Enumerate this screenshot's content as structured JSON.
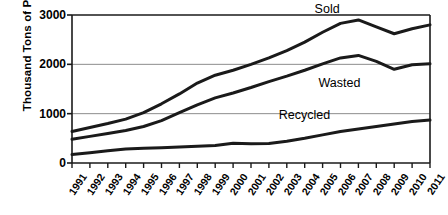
{
  "chart_data": {
    "type": "line",
    "title": "",
    "xlabel": "",
    "ylabel": "Thousand Tons of PET",
    "ylim": [
      0,
      3000
    ],
    "yticks": [
      0,
      1000,
      2000,
      3000
    ],
    "gridlines": [
      1000,
      2000
    ],
    "grid": true,
    "legend_position": "inline-labels",
    "x": [
      "1991",
      "1992",
      "1993",
      "1994",
      "1995",
      "1996",
      "1997",
      "1998",
      "1999",
      "2000",
      "2001",
      "2002",
      "2003",
      "2004",
      "2005",
      "2006",
      "2007",
      "2008",
      "2009",
      "2010",
      "2011"
    ],
    "series": [
      {
        "name": "Sold",
        "values": [
          640,
          720,
          800,
          890,
          1020,
          1200,
          1400,
          1620,
          1780,
          1880,
          2000,
          2130,
          2280,
          2450,
          2650,
          2830,
          2900,
          2760,
          2620,
          2720,
          2800
        ]
      },
      {
        "name": "Wasted",
        "values": [
          480,
          540,
          600,
          660,
          740,
          860,
          1020,
          1180,
          1320,
          1420,
          1530,
          1650,
          1760,
          1880,
          2010,
          2130,
          2180,
          2060,
          1900,
          1990,
          2010
        ]
      },
      {
        "name": "Recycled",
        "values": [
          170,
          210,
          250,
          285,
          300,
          310,
          325,
          340,
          355,
          400,
          390,
          395,
          440,
          500,
          570,
          640,
          690,
          740,
          790,
          840,
          870
        ]
      }
    ]
  },
  "axes": {
    "y_title": "Thousand Tons of PET",
    "y_tick_labels": [
      "3000",
      "2000",
      "1000",
      "0"
    ],
    "x_tick_labels": [
      "1991",
      "1992",
      "1993",
      "1994",
      "1995",
      "1996",
      "1997",
      "1998",
      "1999",
      "2000",
      "2001",
      "2002",
      "2003",
      "2004",
      "2005",
      "2006",
      "2007",
      "2008",
      "2009",
      "2010",
      "2011"
    ]
  },
  "series_labels": {
    "sold": "Sold",
    "wasted": "Wasted",
    "recycled": "Recycled"
  },
  "colors": {
    "line": "#1a1a1a",
    "axis": "#1a1a1a",
    "grid": "#8c8c8c",
    "background": "#ffffff"
  }
}
